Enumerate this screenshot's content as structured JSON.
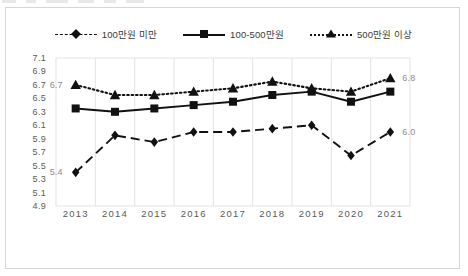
{
  "chart_data": {
    "type": "line",
    "title": "",
    "xlabel": "",
    "ylabel": "",
    "categories": [
      "2013",
      "2014",
      "2015",
      "2016",
      "2017",
      "2018",
      "2019",
      "2020",
      "2021"
    ],
    "ylim": [
      4.9,
      7.1
    ],
    "ytick_step": 0.2,
    "yticks": [
      "7.1",
      "6.9",
      "6.7",
      "6.5",
      "6.3",
      "6.1",
      "5.9",
      "5.7",
      "5.5",
      "5.3",
      "5.1",
      "4.9"
    ],
    "grid": "vertical-only",
    "legend_position": "top-center",
    "series": [
      {
        "name": "100만원 미만",
        "marker": "diamond",
        "linestyle": "dashed",
        "color": "#111111",
        "values": [
          5.4,
          5.95,
          5.85,
          6.0,
          6.0,
          6.05,
          6.1,
          5.65,
          6.0
        ],
        "endpoint_labels": {
          "start": "5.4",
          "end": "6.0"
        }
      },
      {
        "name": "100-500만원",
        "marker": "square",
        "linestyle": "solid",
        "color": "#111111",
        "values": [
          6.35,
          6.3,
          6.35,
          6.4,
          6.45,
          6.55,
          6.6,
          6.45,
          6.6
        ],
        "endpoint_labels": {
          "start": "",
          "end": ""
        }
      },
      {
        "name": "500만원 이상",
        "marker": "triangle",
        "linestyle": "dotted",
        "color": "#111111",
        "values": [
          6.7,
          6.55,
          6.55,
          6.6,
          6.65,
          6.75,
          6.65,
          6.6,
          6.8
        ],
        "endpoint_labels": {
          "start": "6.7",
          "end": "6.8"
        }
      }
    ]
  },
  "legend": {
    "items": [
      {
        "label": "100만원 미만"
      },
      {
        "label": "100-500만원"
      },
      {
        "label": "500만원 이상"
      }
    ]
  },
  "colors": {
    "ink": "#111111",
    "axis_text": "#595959",
    "label_text": "#8c8c8c",
    "grid": "#e3e3e3",
    "border": "#d6d6d6",
    "background": "#ffffff"
  }
}
